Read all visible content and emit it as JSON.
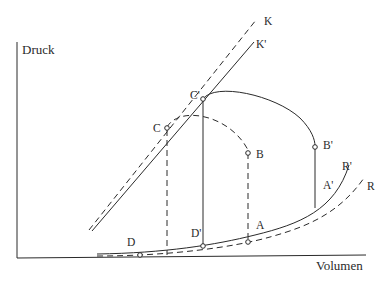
{
  "figure": {
    "type": "pressure-volume diagram",
    "axes": {
      "y_label": "Druck",
      "x_label": "Volumen"
    },
    "lines": [
      {
        "id": "K",
        "label": "K",
        "style": "dashed",
        "kind": "straight"
      },
      {
        "id": "K_prime",
        "label": "K'",
        "style": "solid",
        "kind": "straight"
      },
      {
        "id": "R",
        "label": "R",
        "style": "dashed",
        "kind": "curve"
      },
      {
        "id": "R_prime",
        "label": "R'",
        "style": "solid",
        "kind": "curve"
      }
    ],
    "cycles": [
      {
        "name": "dashed cycle",
        "style": "dashed",
        "points": [
          "A",
          "B",
          "C",
          "D"
        ]
      },
      {
        "name": "solid cycle",
        "style": "solid",
        "points": [
          "A'",
          "B'",
          "C'",
          "D'"
        ]
      }
    ],
    "points": {
      "A": "A",
      "B": "B",
      "C": "C",
      "D": "D",
      "A_prime": "A'",
      "B_prime": "B'",
      "C_prime": "C'",
      "D_prime": "D'"
    },
    "line_labels": {
      "K": "K",
      "K_prime": "K'",
      "R": "R",
      "R_prime": "R'"
    }
  }
}
